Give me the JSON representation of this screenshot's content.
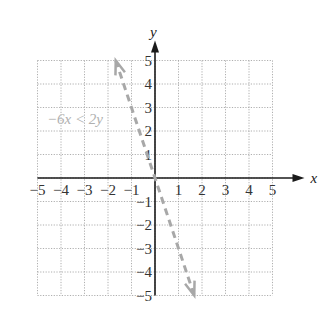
{
  "chart_data": {
    "type": "line",
    "title": "",
    "xlabel": "x",
    "ylabel": "y",
    "xlim": [
      -5,
      5
    ],
    "ylim": [
      -5,
      5
    ],
    "grid": true,
    "x_ticks": [
      "−5",
      "−4",
      "−3",
      "−2",
      "−1",
      "1",
      "2",
      "3",
      "4",
      "5"
    ],
    "y_ticks": [
      "5",
      "4",
      "3",
      "2",
      "1",
      "−1",
      "−2",
      "−3",
      "−4",
      "−5"
    ],
    "series": [
      {
        "name": "−6x < 2y",
        "equation": "y = −3x",
        "style": "dashed",
        "color": "#a8a8a8",
        "points": [
          [
            -1.67,
            5
          ],
          [
            1.67,
            -5
          ]
        ]
      }
    ],
    "annotation": {
      "text": "−6x < 2y",
      "x": -4.6,
      "y": 2.5
    }
  },
  "colors": {
    "axis": "#1a1a1a",
    "grid": "#9a9a9a",
    "line": "#a8a8a8",
    "label": "#b0b0b0"
  }
}
